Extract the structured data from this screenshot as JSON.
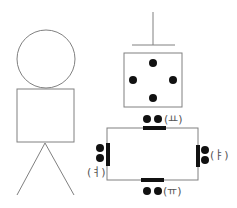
{
  "diagram": {
    "colors": {
      "line": "#808080",
      "dot": "#111111",
      "label": "#555555",
      "background": "#ffffff"
    },
    "figure": {
      "head": {
        "cx": 46,
        "cy": 59,
        "r": 29
      },
      "body": {
        "x": 17,
        "y": 89,
        "w": 57,
        "h": 53
      },
      "legs": [
        {
          "x1": 45,
          "y1": 143,
          "x2": 17,
          "y2": 195
        },
        {
          "x1": 45,
          "y1": 143,
          "x2": 74,
          "y2": 195
        }
      ]
    },
    "dice": {
      "stem": {
        "x": 153,
        "y1": 12,
        "y2": 45
      },
      "ledge": {
        "x1": 132,
        "x2": 175,
        "y": 45
      },
      "square": {
        "x": 124,
        "y": 53,
        "w": 58,
        "h": 54
      },
      "dots": 4
    },
    "frame": {
      "rect": {
        "x": 107,
        "y": 128,
        "w": 91,
        "h": 52
      },
      "labels": {
        "top": "(ㅛ)",
        "right": "(ㅑ)",
        "bottom": "(ㅠ)",
        "left": "(ㅕ)"
      }
    }
  }
}
